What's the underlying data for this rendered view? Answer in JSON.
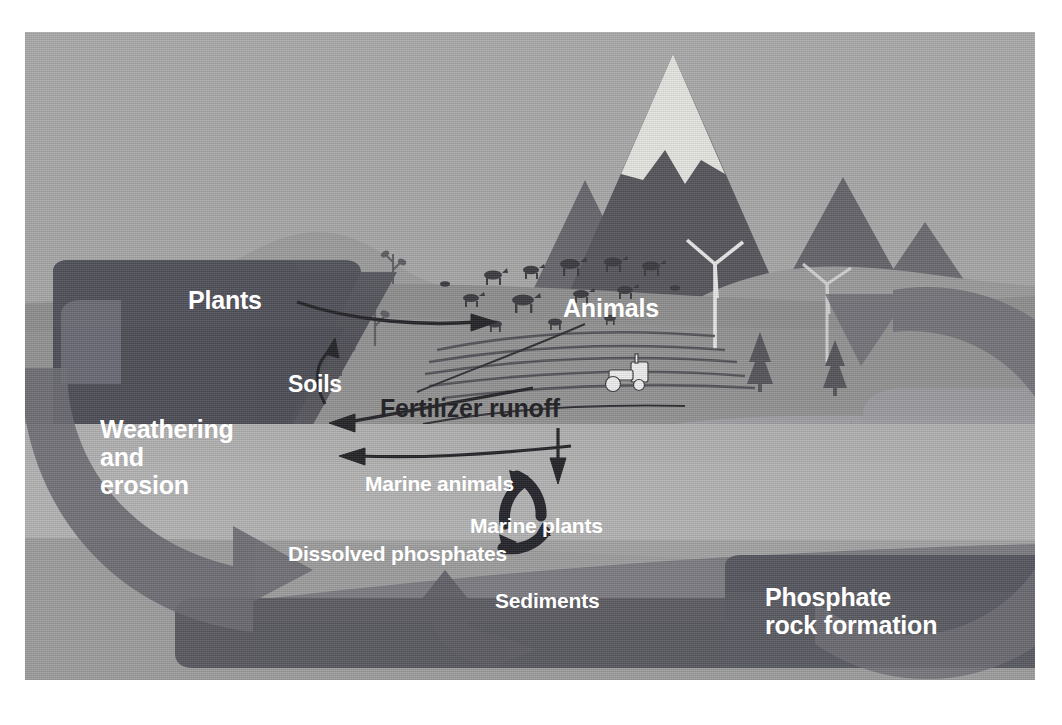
{
  "figure": {
    "kind": "phosphorus-cycle-diagram",
    "background_color": "#a8a8a8",
    "labels": {
      "plants": "Plants",
      "animals": "Animals",
      "soils": "Soils",
      "fertilizer_runoff": "Fertilizer runoff",
      "weathering_and_erosion": "Weathering\nand\nerosion",
      "marine_animals": "Marine animals",
      "marine_plants": "Marine plants",
      "dissolved_phosphates": "Dissolved phosphates",
      "sediments": "Sediments",
      "phosphate_rock_formation": "Phosphate\nrock formation"
    },
    "label_colors": {
      "white": "#ffffff",
      "dark": "#26262a"
    },
    "palette": {
      "sky": "#a8a8a8",
      "mountain_dark": "#5a5a5f",
      "mountain_mid": "#6e6e73",
      "snow": "#e8e8e6",
      "hill_light": "#9a9a9a",
      "hill_mid": "#8e8e8e",
      "land_green": "#8c8c8c",
      "rock_slab_dark": "#4f4f54",
      "rock_slab_mid": "#606065",
      "ocean_upper": "#b4b4b4",
      "ocean_lower": "#9c9c9c",
      "seafloor": "#5c5c61",
      "sediment_wedge": "#7b7b80",
      "arrow_gray": "#6a6a70",
      "arrow_black": "#232327",
      "river": "#9e9ea3",
      "tree": "#55555a"
    },
    "scene_elements": [
      "snow-capped-mountain",
      "secondary-mountains",
      "rolling-hills",
      "shrubs",
      "grazing-livestock",
      "wind-turbines",
      "tractor",
      "plowed-field",
      "pine-trees",
      "river",
      "ocean",
      "seafloor-sediments",
      "phosphate-rock-slab"
    ],
    "arrows": [
      {
        "name": "plants-to-animals",
        "style": "thin-black",
        "direction": "right"
      },
      {
        "name": "animals-to-soils",
        "style": "thin-black",
        "direction": "left"
      },
      {
        "name": "plants-to-soils",
        "style": "thin-black",
        "direction": "up-left"
      },
      {
        "name": "fertilizer-runoff-down",
        "style": "thin-black",
        "direction": "down"
      },
      {
        "name": "weathering-and-erosion",
        "style": "thick-gray-curved",
        "direction": "clockwise-right"
      },
      {
        "name": "marine-cycle",
        "style": "black-arc-triplet",
        "direction": "clockwise"
      },
      {
        "name": "sediments-uplift",
        "style": "thick-gray-curved",
        "direction": "up-right"
      },
      {
        "name": "phosphate-rock-uplift",
        "style": "thick-gray-ring",
        "direction": "counter-clockwise"
      }
    ]
  }
}
